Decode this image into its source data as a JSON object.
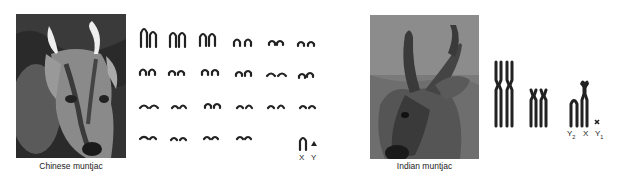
{
  "panels": [
    {
      "species": "Chinese muntjac",
      "photo_icon": "deer-photo-chinese-muntjac",
      "karyotype": {
        "autosome_pairs": 22,
        "rows": 4,
        "sex_chromosomes": [
          "X",
          "Y"
        ]
      }
    },
    {
      "species": "Indian muntjac",
      "photo_icon": "deer-photo-indian-muntjac",
      "karyotype": {
        "autosome_pairs": 2,
        "sex_chromosomes": [
          "Y2",
          "X",
          "Y1"
        ],
        "labels": {
          "y2": "Y",
          "y2_sub": "2",
          "x": "X",
          "y1": "Y",
          "y1_sub": "1"
        }
      }
    }
  ]
}
